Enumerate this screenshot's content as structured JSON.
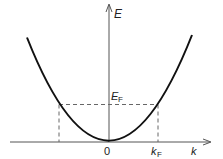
{
  "diagram": {
    "y_axis_label": "E",
    "x_axis_label": "k",
    "fermi_energy_label": "E",
    "fermi_energy_subscript": "F",
    "fermi_wavevector_label": "k",
    "fermi_wavevector_subscript": "F",
    "origin_label": "0",
    "colors": {
      "curve": "#111111",
      "axes": "#555555",
      "dashed": "#666666",
      "background": "#ffffff"
    }
  }
}
